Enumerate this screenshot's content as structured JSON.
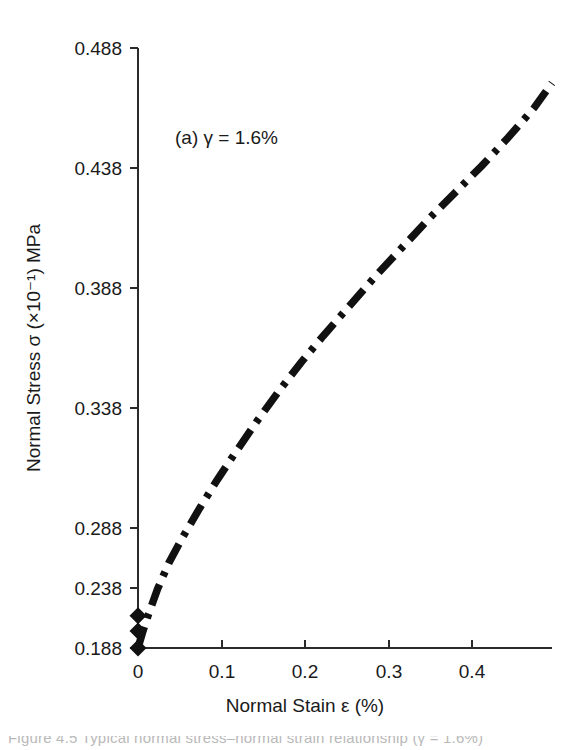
{
  "figure": {
    "caption_fragment": "Figure 4.5  Typical normal stress–normal strain relationship (γ = 1.6%)"
  },
  "chart_data": {
    "type": "line",
    "title": "",
    "subtitle": "",
    "annotation": "(a) γ = 1.6%",
    "xlabel": "Normal Stain ε (%)",
    "ylabel": "Normal Stress σ (×10⁻¹) MPa",
    "xlim": [
      0,
      0.47
    ],
    "ylim": [
      0.188,
      0.5055
    ],
    "xticks": [
      0,
      0.1,
      0.2,
      0.3,
      0.4
    ],
    "xtick_labels": [
      "0",
      "0.1",
      "0.2",
      "0.3",
      "0.4"
    ],
    "yticks": [
      0.188,
      0.238,
      0.288,
      0.338,
      0.388,
      0.438,
      0.488
    ],
    "ytick_labels": [
      "0.188",
      "0.238",
      "0.288",
      "0.338",
      "0.388",
      "0.438",
      "0.488"
    ],
    "grid": false,
    "legend": null,
    "line_style": "dash-dot",
    "line_color": "#111111",
    "series": [
      {
        "name": "Normal stress vs normal strain",
        "x": [
          0.0,
          0.005,
          0.012,
          0.022,
          0.035,
          0.05,
          0.07,
          0.09,
          0.11,
          0.135,
          0.16,
          0.185,
          0.21,
          0.24,
          0.27,
          0.3,
          0.33,
          0.36,
          0.39,
          0.42,
          0.45,
          0.47
        ],
        "y": [
          0.188,
          0.196,
          0.206,
          0.219,
          0.233,
          0.246,
          0.262,
          0.277,
          0.291,
          0.308,
          0.324,
          0.339,
          0.353,
          0.369,
          0.385,
          0.4,
          0.415,
          0.429,
          0.443,
          0.458,
          0.474,
          0.487
        ]
      }
    ],
    "markers_at_origin": {
      "x": [
        0,
        0,
        0
      ],
      "y": [
        0.188,
        0.197,
        0.205
      ],
      "shape": "diamond"
    }
  }
}
